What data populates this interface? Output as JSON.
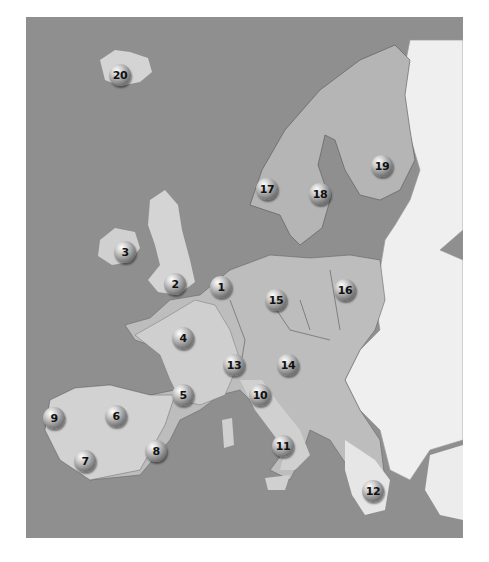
{
  "map": {
    "title": "Europe numbered locations map",
    "colors": {
      "sea": "#8f8f8f",
      "highlighted_land": "#b5b5b5",
      "relief_land": "#d4d4d4",
      "other_land": "#efefef",
      "border": "#555555"
    },
    "markers": [
      {
        "id": "1",
        "label": "1",
        "x": 221,
        "y": 287
      },
      {
        "id": "2",
        "label": "2",
        "x": 175,
        "y": 284
      },
      {
        "id": "3",
        "label": "3",
        "x": 125,
        "y": 252
      },
      {
        "id": "4",
        "label": "4",
        "x": 183,
        "y": 338
      },
      {
        "id": "5",
        "label": "5",
        "x": 183,
        "y": 395
      },
      {
        "id": "6",
        "label": "6",
        "x": 116,
        "y": 416
      },
      {
        "id": "7",
        "label": "7",
        "x": 85,
        "y": 461
      },
      {
        "id": "8",
        "label": "8",
        "x": 156,
        "y": 451
      },
      {
        "id": "9",
        "label": "9",
        "x": 54,
        "y": 418
      },
      {
        "id": "10",
        "label": "10",
        "x": 260,
        "y": 395
      },
      {
        "id": "11",
        "label": "11",
        "x": 283,
        "y": 446
      },
      {
        "id": "12",
        "label": "12",
        "x": 373,
        "y": 491
      },
      {
        "id": "13",
        "label": "13",
        "x": 234,
        "y": 365
      },
      {
        "id": "14",
        "label": "14",
        "x": 288,
        "y": 365
      },
      {
        "id": "15",
        "label": "15",
        "x": 276,
        "y": 300
      },
      {
        "id": "16",
        "label": "16",
        "x": 345,
        "y": 290
      },
      {
        "id": "17",
        "label": "17",
        "x": 267,
        "y": 189
      },
      {
        "id": "18",
        "label": "18",
        "x": 320,
        "y": 194
      },
      {
        "id": "19",
        "label": "19",
        "x": 382,
        "y": 166
      },
      {
        "id": "20",
        "label": "20",
        "x": 120,
        "y": 75
      }
    ]
  }
}
